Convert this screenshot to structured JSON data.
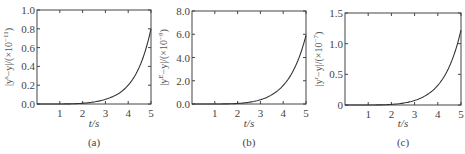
{
  "chart_data": [
    {
      "type": "line",
      "panel": "(a)",
      "xlabel": "t/s",
      "ylabel": "|y^s − y|/(×10^−11)",
      "ylabel_parts": {
        "pre": "|y",
        "sup1": "s",
        "mid": "−y|/(×10",
        "sup2": "−11",
        "post": ")"
      },
      "xlim": [
        0,
        5
      ],
      "ylim": [
        0,
        1.0
      ],
      "xticks": [
        1,
        2,
        3,
        4,
        5
      ],
      "yticks": [
        0.0,
        0.2,
        0.4,
        0.6,
        0.8,
        1.0
      ],
      "yticklabels": [
        "0.0",
        "0.2",
        "0.4",
        "0.6",
        "0.8",
        "1.0"
      ],
      "x": [
        0,
        0.5,
        1.0,
        1.5,
        2.0,
        2.5,
        3.0,
        3.5,
        4.0,
        4.5,
        5.0
      ],
      "y": [
        0,
        0,
        0,
        0.002,
        0.008,
        0.022,
        0.05,
        0.1,
        0.2,
        0.4,
        0.8
      ]
    },
    {
      "type": "line",
      "panel": "(b)",
      "xlabel": "t/s",
      "ylabel": "|y^E − y|/(×10^−8)",
      "ylabel_parts": {
        "pre": "|y",
        "sup1": "E",
        "mid": "−y|/(×10",
        "sup2": "−8",
        "post": ")"
      },
      "xlim": [
        0,
        5
      ],
      "ylim": [
        0,
        8.0
      ],
      "xticks": [
        1,
        2,
        3,
        4,
        5
      ],
      "yticks": [
        0.0,
        2.0,
        4.0,
        6.0,
        8.0
      ],
      "yticklabels": [
        "0.0",
        "2.0",
        "4.0",
        "6.0",
        "8.0"
      ],
      "x": [
        0,
        0.5,
        1.0,
        1.5,
        2.0,
        2.5,
        3.0,
        3.5,
        4.0,
        4.5,
        5.0
      ],
      "y": [
        0,
        0,
        0,
        0.01,
        0.05,
        0.15,
        0.37,
        0.8,
        1.6,
        3.1,
        5.9
      ]
    },
    {
      "type": "line",
      "panel": "(c)",
      "xlabel": "t/s",
      "ylabel": "|y^r − y|/(×10^−7)",
      "ylabel_parts": {
        "pre": "|y",
        "sup1": "r",
        "mid": "−y|/(×10",
        "sup2": "−7",
        "post": ")"
      },
      "xlim": [
        0,
        5
      ],
      "ylim": [
        0,
        1.5
      ],
      "xticks": [
        1,
        2,
        3,
        4,
        5
      ],
      "yticks": [
        0,
        0.5,
        1.0,
        1.5
      ],
      "yticklabels": [
        "0",
        "0.5",
        "1.0",
        "1.5"
      ],
      "x": [
        0,
        0.5,
        1.0,
        1.5,
        2.0,
        2.5,
        3.0,
        3.5,
        4.0,
        4.5,
        5.0
      ],
      "y": [
        0,
        0,
        0,
        0.002,
        0.01,
        0.03,
        0.075,
        0.16,
        0.32,
        0.63,
        1.22
      ]
    }
  ],
  "panels": [
    {
      "caption": "(a)",
      "xlabel": "t/s"
    },
    {
      "caption": "(b)",
      "xlabel": "t/s"
    },
    {
      "caption": "(c)",
      "xlabel": "t/s"
    }
  ]
}
